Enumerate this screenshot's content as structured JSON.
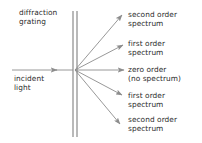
{
  "diagram": {
    "colors": {
      "stroke": "#8c8c8c",
      "grating": "#a0a0a0",
      "text": "#2b2b2b",
      "background": "#ffffff"
    },
    "labels": {
      "grating": "diffraction\ngrating",
      "incident": "incident\nlight",
      "second_order_top": "second order\nspectrum",
      "first_order_top": "first order\nspectrum",
      "zero_order": "zero order\n(no spectrum)",
      "first_order_bottom": "first order\nspectrum",
      "second_order_bottom": "second order\nspectrum"
    },
    "grating": {
      "x": 75,
      "y_top": 11,
      "y_bottom": 137,
      "line_offsets": [
        -2,
        2
      ]
    },
    "incident_ray": {
      "from": [
        12,
        70
      ],
      "to": [
        57,
        70
      ],
      "arrow": true
    },
    "diffracted_rays": [
      {
        "name": "second-order-up",
        "order": 2,
        "direction": "up",
        "from": [
          75,
          70
        ],
        "to": [
          122,
          15
        ]
      },
      {
        "name": "first-order-up",
        "order": 1,
        "direction": "up",
        "from": [
          75,
          70
        ],
        "to": [
          123,
          45
        ]
      },
      {
        "name": "zero-order",
        "order": 0,
        "direction": "straight",
        "from": [
          75,
          70
        ],
        "to": [
          124,
          70
        ]
      },
      {
        "name": "first-order-down",
        "order": 1,
        "direction": "down",
        "from": [
          75,
          70
        ],
        "to": [
          122,
          95
        ]
      },
      {
        "name": "second-order-down",
        "order": 2,
        "direction": "down",
        "from": [
          75,
          70
        ],
        "to": [
          120,
          124
        ]
      }
    ]
  }
}
